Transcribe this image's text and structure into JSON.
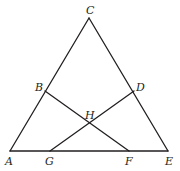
{
  "diagram": {
    "type": "geometry",
    "points": {
      "A": {
        "label": "A",
        "x": 10,
        "y": 151
      },
      "C": {
        "label": "C",
        "x": 89,
        "y": 18
      },
      "E": {
        "label": "E",
        "x": 168,
        "y": 151
      },
      "B": {
        "label": "B",
        "x": 45,
        "y": 91
      },
      "D": {
        "label": "D",
        "x": 134,
        "y": 91
      },
      "G": {
        "label": "G",
        "x": 50,
        "y": 151
      },
      "F": {
        "label": "F",
        "x": 129,
        "y": 151
      },
      "H": {
        "label": "H",
        "x": 89,
        "y": 123
      }
    },
    "segments": [
      [
        "A",
        "C"
      ],
      [
        "C",
        "E"
      ],
      [
        "A",
        "E"
      ],
      [
        "B",
        "F"
      ],
      [
        "D",
        "G"
      ]
    ],
    "labels": {
      "A": "A",
      "B": "B",
      "C": "C",
      "D": "D",
      "E": "E",
      "F": "F",
      "G": "G",
      "H": "H"
    },
    "line_color": "#231f20"
  }
}
